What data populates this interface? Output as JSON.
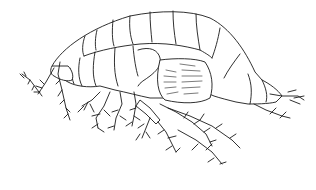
{
  "image": {
    "subject": "amphipod-illustration",
    "style": "black line drawing on white",
    "background_color": "#ffffff",
    "line_color": "#1a1a1a"
  }
}
